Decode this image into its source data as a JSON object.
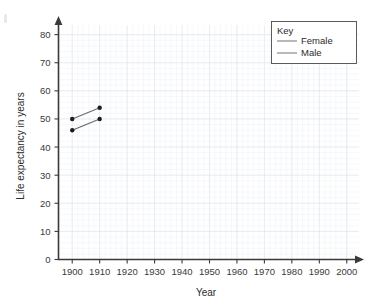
{
  "chart_data": {
    "type": "line",
    "title": "",
    "xlabel": "Year",
    "ylabel": "Life expectancy in years",
    "xlim": [
      1895,
      2003
    ],
    "ylim": [
      0,
      82
    ],
    "xticks": [
      1900,
      1910,
      1920,
      1930,
      1940,
      1950,
      1960,
      1970,
      1980,
      1990,
      2000
    ],
    "yticks": [
      0,
      10,
      20,
      30,
      40,
      50,
      60,
      70,
      80
    ],
    "grid": true,
    "legend_position": "top-right",
    "legend_title": "Key",
    "x": [
      1900,
      1910
    ],
    "series": [
      {
        "name": "Female",
        "values": [
          50,
          54
        ],
        "color": "#6b6b6b"
      },
      {
        "name": "Male",
        "values": [
          46,
          50
        ],
        "color": "#6b6b6b"
      }
    ]
  },
  "axes": {
    "y_title": "Life expectancy in years",
    "x_title": "Year",
    "x_tick_labels": [
      "1900",
      "1910",
      "1920",
      "1930",
      "1940",
      "1950",
      "1960",
      "1970",
      "1980",
      "1990",
      "2000"
    ],
    "y_tick_labels": [
      "0",
      "10",
      "20",
      "30",
      "40",
      "50",
      "60",
      "70",
      "80"
    ]
  },
  "legend": {
    "title": "Key",
    "entries": [
      {
        "label": "Female"
      },
      {
        "label": "Male"
      }
    ]
  },
  "colors": {
    "grid": "#dfe4ec",
    "axis": "#3a3a3a",
    "series": "#6b6b6b",
    "marker": "#1d1d1d",
    "text": "#2b2b2b",
    "background": "#ffffff"
  }
}
